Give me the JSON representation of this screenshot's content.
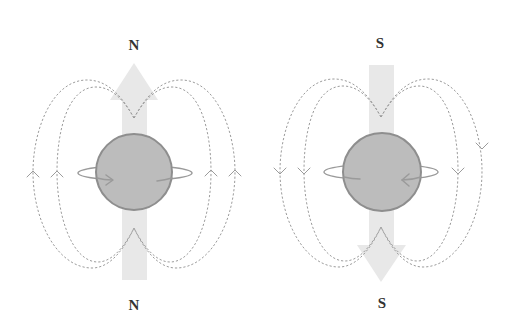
{
  "diagram": {
    "title": "",
    "figures": [
      {
        "name": "north-dipole",
        "top_label": "N",
        "bottom_label": "N",
        "axis_arrow": "arrow-up-icon",
        "field_line_arrows": "chevron-up-icon",
        "spin_arrow": "arrow-right-icon"
      },
      {
        "name": "south-dipole",
        "top_label": "S",
        "bottom_label": "S",
        "axis_arrow": "arrow-down-icon",
        "field_line_arrows": "chevron-down-icon",
        "spin_arrow": "arrow-left-icon"
      }
    ]
  },
  "colors": {
    "background": "#ffffff",
    "axis_arrow_fill": "#e8e8e8",
    "sphere_fill": "#bcbcbc",
    "sphere_stroke": "#8e8e8e",
    "field_line": "#9c9c9c",
    "ring": "#9a9a9a",
    "label": "#333333"
  }
}
